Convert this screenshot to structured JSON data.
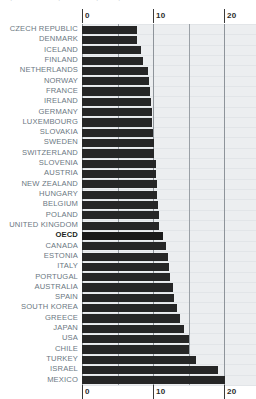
{
  "meta": {
    "top_fragment_1": "·",
    "top_fragment_2": "·",
    "top_fragment_3": "·",
    "top_fragment_4": "·"
  },
  "colors": {
    "bar": "#262626",
    "plot_background": "#eceef0",
    "label": "#6b7782",
    "label_highlight": "#1c1f22",
    "gridline": "#9aa0a6",
    "tick_text": "#2b2b2b",
    "page_background": "#ffffff"
  },
  "axis": {
    "position_top": true,
    "position_bottom": true,
    "ticks": [
      {
        "label": "0",
        "value": 0
      },
      {
        "label": "10",
        "value": 10
      },
      {
        "label": "20",
        "value": 20
      }
    ],
    "gridline_values": [
      0,
      5,
      10,
      15,
      20,
      24.5
    ],
    "min": 0,
    "max": 24.5
  },
  "chart_data": {
    "type": "bar",
    "orientation": "horizontal",
    "title": "",
    "subtitle": "",
    "xlabel": "",
    "ylabel": "",
    "xlim": [
      0,
      24.5
    ],
    "grid": true,
    "legend": "none",
    "highlight_category": "OECD",
    "categories": [
      "CZECH REPUBLIC",
      "DENMARK",
      "ICELAND",
      "FINLAND",
      "NETHERLANDS",
      "NORWAY",
      "FRANCE",
      "IRELAND",
      "GERMANY",
      "LUXEMBOURG",
      "SLOVAKIA",
      "SWEDEN",
      "SWITZERLAND",
      "SLOVENIA",
      "AUSTRIA",
      "NEW ZEALAND",
      "HUNGARY",
      "BELGIUM",
      "POLAND",
      "UNITED KINGDOM",
      "OECD",
      "CANADA",
      "ESTONIA",
      "ITALY",
      "PORTUGAL",
      "AUSTRALIA",
      "SPAIN",
      "SOUTH KOREA",
      "GREECE",
      "JAPAN",
      "USA",
      "CHILE",
      "TURKEY",
      "ISRAEL",
      "MEXICO"
    ],
    "values": [
      7.7,
      7.7,
      8.3,
      8.6,
      9.3,
      9.5,
      9.6,
      9.7,
      9.8,
      9.9,
      10.0,
      10.1,
      10.2,
      10.4,
      10.4,
      10.5,
      10.6,
      10.7,
      10.8,
      10.9,
      11.4,
      11.8,
      12.1,
      12.3,
      12.4,
      12.8,
      12.9,
      13.4,
      13.8,
      14.4,
      15.0,
      15.1,
      16.1,
      19.2,
      20.1
    ]
  }
}
